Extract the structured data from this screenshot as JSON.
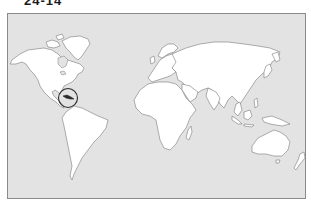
{
  "header": {
    "figure_label": "24-14",
    "secondary_caption": ""
  },
  "map": {
    "type": "world-outline",
    "projection": "equirectangular-style",
    "ocean_color": "#e3e3e3",
    "land_color": "#ffffff",
    "outline_color": "#7a7a7a",
    "highlight": {
      "region": "Cuba",
      "marker": "circle",
      "color": "#2a2a2a"
    },
    "continents": [
      "North America",
      "South America",
      "Europe",
      "Asia",
      "Africa",
      "Australia"
    ]
  }
}
